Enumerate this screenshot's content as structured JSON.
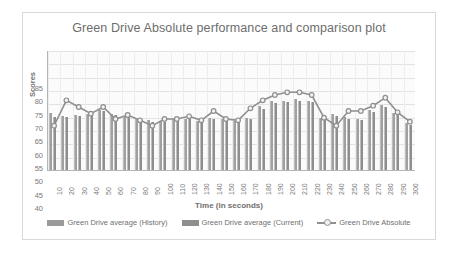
{
  "chart_data": {
    "type": "bar",
    "title": "Green Drive Absolute performance and comparison plot",
    "xlabel": "Time (in seconds)",
    "ylabel": "Scores",
    "ylim": [
      40,
      85
    ],
    "ytick_step": 5,
    "yticks": [
      85,
      80,
      75,
      70,
      65,
      60,
      55,
      50,
      45,
      40
    ],
    "grid": true,
    "legend_position": "bottom",
    "categories": [
      10,
      20,
      30,
      40,
      50,
      60,
      70,
      80,
      90,
      100,
      110,
      120,
      130,
      140,
      150,
      160,
      170,
      180,
      190,
      200,
      210,
      220,
      230,
      240,
      250,
      260,
      270,
      280,
      290,
      300
    ],
    "series": [
      {
        "name": "Green Drive average (History)",
        "type": "bar",
        "color": "#a0a0a0",
        "values": [
          61.5,
          60.2,
          60.5,
          61.0,
          62.5,
          61.2,
          60.0,
          59.0,
          58.8,
          58.5,
          59.0,
          59.2,
          58.5,
          59.5,
          59.2,
          58.5,
          59.5,
          64.0,
          66.0,
          66.0,
          66.5,
          66.0,
          59.5,
          61.0,
          60.0,
          59.2,
          62.5,
          64.5,
          61.5,
          57.5
        ]
      },
      {
        "name": "Green Drive average (Current)",
        "type": "bar",
        "color": "#8e8e8e",
        "values": [
          60.0,
          60.0,
          60.2,
          60.8,
          62.0,
          60.5,
          59.8,
          58.8,
          58.0,
          58.2,
          58.8,
          59.0,
          58.2,
          59.2,
          58.8,
          58.2,
          59.2,
          63.0,
          65.2,
          65.5,
          66.0,
          65.5,
          59.0,
          60.2,
          59.2,
          58.8,
          61.8,
          63.5,
          61.0,
          57.0
        ]
      },
      {
        "name": "Green Drive Absolute",
        "type": "line",
        "color": "#8f8f8f",
        "marker": "circle",
        "values": [
          57.0,
          66.5,
          64.0,
          61.5,
          64.0,
          59.5,
          61.0,
          59.0,
          57.0,
          59.5,
          59.5,
          60.5,
          59.0,
          62.5,
          59.5,
          59.0,
          63.5,
          66.5,
          68.5,
          69.5,
          69.5,
          68.5,
          60.0,
          57.0,
          62.5,
          62.5,
          64.5,
          67.5,
          62.0,
          58.5
        ]
      }
    ]
  },
  "legend": {
    "items": [
      {
        "label": "Green Drive average (History)"
      },
      {
        "label": "Green Drive average (Current)"
      },
      {
        "label": "Green Drive Absolute"
      }
    ]
  }
}
